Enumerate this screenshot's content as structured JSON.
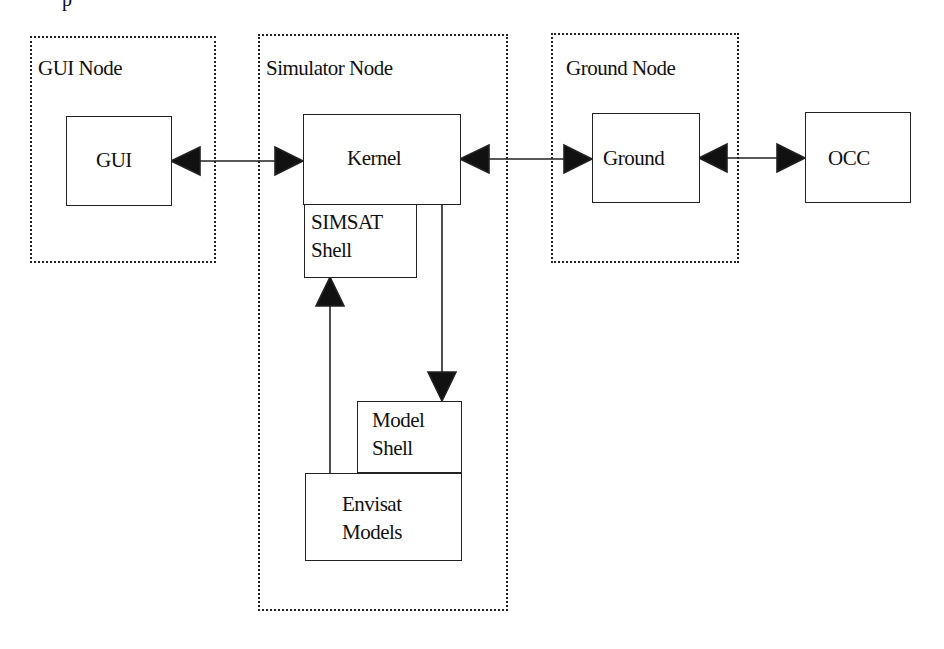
{
  "diagram": {
    "top_fragment": "p",
    "nodes": [
      {
        "id": "gui-node",
        "label": "GUI Node"
      },
      {
        "id": "simulator-node",
        "label": "Simulator Node"
      },
      {
        "id": "ground-node",
        "label": "Ground Node"
      }
    ],
    "boxes": {
      "gui": "GUI",
      "kernel": "Kernel",
      "simsat_shell": "SIMSAT\nShell",
      "model_shell": "Model\nShell",
      "envisat_models": "Envisat\nModels",
      "ground": "Ground",
      "occ": "OCC"
    },
    "connections": [
      {
        "from": "GUI",
        "to": "Kernel",
        "type": "bidirectional"
      },
      {
        "from": "Kernel",
        "to": "Ground",
        "type": "bidirectional"
      },
      {
        "from": "Ground",
        "to": "OCC",
        "type": "bidirectional"
      },
      {
        "from": "Kernel",
        "to": "Model Shell",
        "type": "directed"
      },
      {
        "from": "Envisat Models",
        "to": "SIMSAT Shell",
        "type": "directed"
      }
    ],
    "colors": {
      "line": "#222222",
      "background": "#ffffff"
    }
  }
}
